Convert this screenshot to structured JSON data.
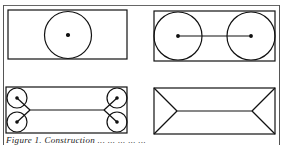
{
  "figure": {
    "caption": "Figure 1.  Construction ... ... ... ... ...",
    "panels": [
      {
        "id": "a",
        "description": "rectangle with one inscribed circle and center dot"
      },
      {
        "id": "b",
        "description": "rectangle with two inscribed circles joined by a center line"
      },
      {
        "id": "c",
        "description": "rectangle with four corner circles and skeleton lines"
      },
      {
        "id": "d",
        "description": "rectangle medial axis skeleton"
      }
    ],
    "colors": {
      "stroke": "#111111",
      "background": "#ffffff"
    }
  }
}
